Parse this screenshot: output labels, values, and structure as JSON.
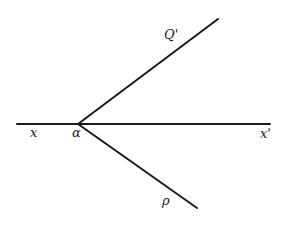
{
  "diagram": {
    "stroke_color": "#1a1a1a",
    "background": "#ffffff",
    "lines": [
      {
        "name": "horizontal-line-xx",
        "x1": 17,
        "y1": 124,
        "x2": 270,
        "y2": 124
      },
      {
        "name": "ray-to-q",
        "x1": 78,
        "y1": 124,
        "x2": 218,
        "y2": 19
      },
      {
        "name": "ray-to-p",
        "x1": 78,
        "y1": 124,
        "x2": 197,
        "y2": 208
      }
    ],
    "labels": {
      "q_prime": "Q'",
      "x": "x",
      "alpha": "α",
      "x_prime": "x'",
      "p": "ρ"
    }
  }
}
